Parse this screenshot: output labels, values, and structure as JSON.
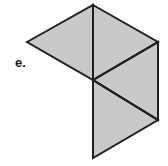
{
  "figure": {
    "label": "e.",
    "label_position": {
      "x": 15,
      "y": 56
    },
    "canvas": {
      "width": 168,
      "height": 166
    },
    "background_color": "#ffffff",
    "fill_color": "#c9c9c9",
    "stroke_color": "#231f20",
    "stroke_width": 2,
    "vertices": {
      "top": {
        "x": 93,
        "y": 5
      },
      "left": {
        "x": 27,
        "y": 42
      },
      "right": {
        "x": 158,
        "y": 42
      },
      "center": {
        "x": 93,
        "y": 80
      },
      "bottom_right": {
        "x": 158,
        "y": 120
      },
      "bottom": {
        "x": 93,
        "y": 158
      }
    },
    "faces": [
      {
        "name": "upper-left-triangle",
        "points": "27,42 93,5 93,80"
      },
      {
        "name": "upper-right-triangle",
        "points": "93,5 158,42 93,80"
      },
      {
        "name": "middle-right-triangle",
        "points": "93,80 158,42 158,120"
      },
      {
        "name": "lower-right-triangle",
        "points": "93,80 158,120 93,158"
      }
    ],
    "interior_lines": [
      {
        "name": "vertical-divider-upper",
        "x1": 93,
        "y1": 5,
        "x2": 93,
        "y2": 80
      },
      {
        "name": "diagonal-center-to-right",
        "x1": 93,
        "y1": 80,
        "x2": 158,
        "y2": 42
      },
      {
        "name": "diagonal-center-to-bottom-right",
        "x1": 93,
        "y1": 80,
        "x2": 158,
        "y2": 120
      },
      {
        "name": "vertical-divider-lower",
        "x1": 93,
        "y1": 80,
        "x2": 93,
        "y2": 158
      }
    ]
  }
}
